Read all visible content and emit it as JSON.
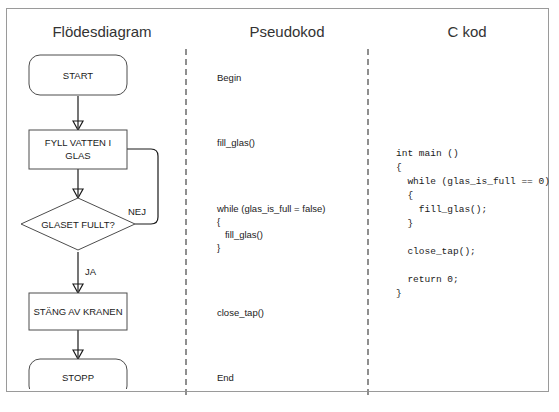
{
  "page": {
    "columns": [
      {
        "id": "flowchart",
        "title": "Flödesdiagram"
      },
      {
        "id": "pseudocode",
        "title": "Pseudokod"
      },
      {
        "id": "ccode",
        "title": "C kod"
      }
    ]
  },
  "flowchart": {
    "nodes": [
      {
        "id": "start",
        "shape": "terminator",
        "label": "START"
      },
      {
        "id": "fill",
        "shape": "process",
        "label_line1": "FYLL VATTEN I",
        "label_line2": "GLAS"
      },
      {
        "id": "decision",
        "shape": "decision",
        "label": "GLASET FULLT?"
      },
      {
        "id": "close_tap",
        "shape": "process",
        "label": "STÄNG AV KRANEN"
      },
      {
        "id": "stop",
        "shape": "terminator",
        "label": "STOPP"
      }
    ],
    "edge_labels": {
      "no": "NEJ",
      "yes": "JA"
    }
  },
  "pseudocode": {
    "lines": [
      {
        "text": "Begin",
        "top": 22
      },
      {
        "text": "fill_glas()",
        "top": 87
      },
      {
        "text": "while (glas_is_full = false)",
        "top": 153
      },
      {
        "text": "{",
        "top": 166
      },
      {
        "text": "   fill_glas()",
        "top": 179
      },
      {
        "text": "}",
        "top": 192
      },
      {
        "text": "close_tap()",
        "top": 257
      },
      {
        "text": "End",
        "top": 322
      }
    ]
  },
  "ccode": {
    "text": "int main ()\n{\n  while (glas_is_full == 0)\n  {\n    fill_glas();\n  }\n\n  close_tap();\n\n  return 0;\n}"
  },
  "colors": {
    "frame_border": "#9a9a9a",
    "shape_stroke": "#4d4d4d",
    "connector": "#1a1a1a",
    "separator": "#8f8f8f",
    "text": "#1a1a1a",
    "title_text": "#333333",
    "background": "#ffffff"
  }
}
